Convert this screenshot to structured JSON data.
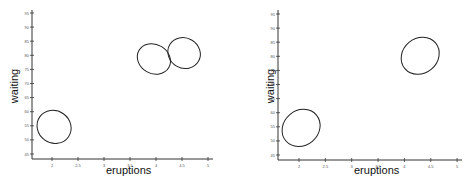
{
  "chart_data": [
    {
      "type": "contour",
      "title": "",
      "xlabel": "eruptions",
      "ylabel": "waiting",
      "xlim": [
        1.6,
        5.1
      ],
      "ylim": [
        43,
        96
      ],
      "xticks": [
        "2",
        "2.5",
        "3",
        "3.5",
        "4",
        "4.5",
        "5"
      ],
      "yticks": [
        "45",
        "50",
        "55",
        "60",
        "65",
        "70",
        "75",
        "80",
        "85",
        "90",
        "95"
      ],
      "grid": false,
      "components": [
        {
          "name": "component 1",
          "center": [
            2.04,
            54.6
          ],
          "rx": 0.31,
          "ry": 6.2,
          "tilt_deg": -55
        },
        {
          "name": "component 2",
          "center": [
            3.96,
            78.7
          ],
          "rx": 0.28,
          "ry": 6.1,
          "tilt_deg": -60
        },
        {
          "name": "component 3",
          "center": [
            4.54,
            80.8
          ],
          "rx": 0.29,
          "ry": 5.9,
          "tilt_deg": -60
        }
      ]
    },
    {
      "type": "contour",
      "title": "",
      "xlabel": "eruptions",
      "ylabel": "waiting",
      "xlim": [
        1.6,
        5.1
      ],
      "ylim": [
        43,
        96
      ],
      "xticks": [
        "2",
        "2.5",
        "3",
        "3.5",
        "4",
        "4.5",
        "5"
      ],
      "yticks": [
        "45",
        "50",
        "55",
        "60",
        "65",
        "70",
        "75",
        "80",
        "85",
        "90",
        "95"
      ],
      "grid": false,
      "components": [
        {
          "name": "component 1",
          "center": [
            2.04,
            54.6
          ],
          "rx": 0.38,
          "ry": 6.2,
          "tilt_deg": -40
        },
        {
          "name": "component 2",
          "center": [
            4.3,
            80.2
          ],
          "rx": 0.38,
          "ry": 6.2,
          "tilt_deg": -40
        }
      ]
    }
  ],
  "panels": [
    {
      "xlabel": "eruptions",
      "ylabel": "waiting"
    },
    {
      "xlabel": "eruptions",
      "ylabel": "waiting"
    }
  ]
}
